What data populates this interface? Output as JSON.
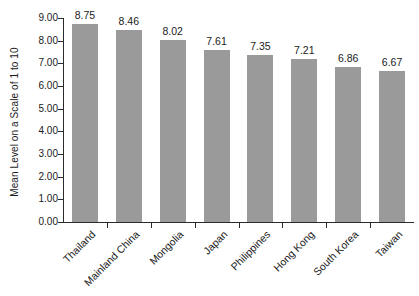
{
  "chart_data": {
    "type": "bar",
    "title": "",
    "subtitle": "",
    "xlabel": "",
    "ylabel": "Mean Level on a Scale of 1 to 10",
    "ylim": [
      0,
      9
    ],
    "ytick_labels": [
      "9.00",
      "8.00",
      "7.00",
      "6.00",
      "5.00",
      "4.00",
      "3.00",
      "2.00",
      "1.00",
      "0.00"
    ],
    "ytick_values": [
      9,
      8,
      7,
      6,
      5,
      4,
      3,
      2,
      1,
      0
    ],
    "grid": false,
    "legend": "none",
    "bar_color": "#9a9a9a",
    "axis_color": "#2b2b2b",
    "background_color": "#ffffff",
    "categories": [
      "Thailand",
      "Mainland China",
      "Mongolia",
      "Japan",
      "Philippines",
      "Hong Kong",
      "South Korea",
      "Taiwan"
    ],
    "values": [
      8.75,
      8.46,
      8.02,
      7.61,
      7.35,
      7.21,
      6.86,
      6.67
    ],
    "value_labels": [
      "8.75",
      "8.46",
      "8.02",
      "7.61",
      "7.35",
      "7.21",
      "6.86",
      "6.67"
    ]
  }
}
